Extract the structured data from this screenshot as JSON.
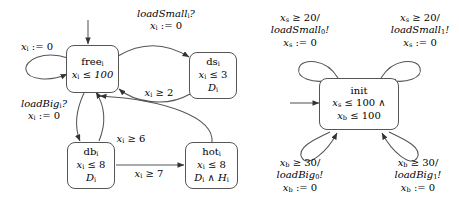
{
  "diagram": {
    "automata": [
      {
        "id": "machine",
        "nodes": [
          {
            "id": "free",
            "name": "free",
            "sub": "i",
            "lines": [
              "x_i ≤ 100"
            ]
          },
          {
            "id": "ds",
            "name": "ds",
            "sub": "i",
            "lines": [
              "x_i ≤ 3",
              "D_i"
            ]
          },
          {
            "id": "db",
            "name": "db",
            "sub": "i",
            "lines": [
              "x_i ≤ 8",
              "D_i"
            ]
          },
          {
            "id": "hot",
            "name": "hot",
            "sub": "i",
            "lines": [
              "x_i ≤ 8",
              "D_i ∧ H_i"
            ]
          }
        ],
        "labels": {
          "free_self": "x_i := 0",
          "free_to_ds": [
            "loadSmall_i?",
            "x_i := 0"
          ],
          "ds_to_free": "x_i ≥ 2",
          "free_to_db": [
            "loadBig_i?",
            "x_i := 0"
          ],
          "db_to_free": "x_i ≥ 6",
          "db_to_hot": "x_i ≥ 7"
        }
      },
      {
        "id": "scheduler",
        "nodes": [
          {
            "id": "init",
            "name": "init",
            "sub": "",
            "lines": [
              "x_s ≤ 100 ∧",
              "x_b ≤ 100"
            ]
          }
        ],
        "labels": {
          "small0": [
            "x_s ≥ 20/",
            "loadSmall_0!",
            "x_s := 0"
          ],
          "small1": [
            "x_s ≥ 20/",
            "loadSmall_1!",
            "x_s := 0"
          ],
          "big0": [
            "x_b ≥ 30/",
            "loadBig_0!",
            "x_b := 0"
          ],
          "big1": [
            "x_b ≥ 30/",
            "loadBig_1!",
            "x_b := 0"
          ]
        }
      }
    ],
    "colors": {
      "stroke": "#555555",
      "text": "#000000",
      "background": "#ffffff"
    }
  }
}
